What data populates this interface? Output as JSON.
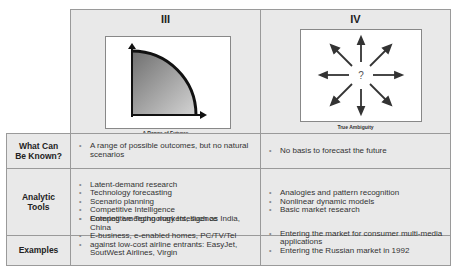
{
  "columns": [
    {
      "numeral": "III",
      "caption": "A Range of Futures",
      "figure": "quarter-circle-range-icon"
    },
    {
      "numeral": "IV",
      "caption": "True Ambiguity",
      "figure": "radiating-arrows-question-icon",
      "center_symbol": "?"
    }
  ],
  "rows": [
    {
      "label_line1": "What Can",
      "label_line2": "Be Known?",
      "col3": [
        "A range of possible outcomes, but no natural scenarios"
      ],
      "col4": [
        "No basis to forecast the future"
      ]
    },
    {
      "label_line1": "Analytic",
      "label_line2": "Tools",
      "col3": [
        "Latent-demand research",
        "Technology forecasting",
        "Scenario planning",
        "Competitive Intelligence",
        "Competitive Technology Intelligence"
      ],
      "col4": [
        "Analogies and pattern recognition",
        "Nonlinear dynamic models",
        "Basic market research"
      ]
    },
    {
      "label_line1": "Examples",
      "label_line2": "",
      "col3": [
        "Entering emerging markets, such as India, China",
        "E-business, e-enabled homes, PC/TV/Tel",
        "against low-cost airline entrants: EasyJet, SoutWest Airlines, Virgin"
      ],
      "col4": [
        "Entering the market for consumer multi-media applications",
        "Entering the Russian market in 1992"
      ]
    }
  ],
  "colors": {
    "cell_bg": "#e9e9e9",
    "border": "#9a9a9a",
    "fig_fill_dark": "#6f6f6f",
    "fig_fill_light": "#cfcfcf"
  }
}
